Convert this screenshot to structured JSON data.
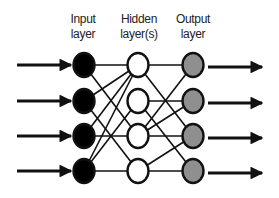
{
  "diagram": {
    "layers": [
      {
        "name": "input",
        "label_line1": "Input",
        "label_line2": "layer",
        "node_count": 4,
        "fill": "#000000"
      },
      {
        "name": "hidden",
        "label_line1": "Hidden",
        "label_line2": "layer(s)",
        "node_count": 4,
        "fill": "#ffffff"
      },
      {
        "name": "output",
        "label_line1": "Output",
        "label_line2": "layer",
        "node_count": 4,
        "fill": "#8f8f8f"
      }
    ],
    "input_arrows": 4,
    "output_arrows": 4,
    "edges_input_hidden": [
      [
        0,
        0
      ],
      [
        0,
        2
      ],
      [
        1,
        0
      ],
      [
        1,
        3
      ],
      [
        2,
        0
      ],
      [
        2,
        2
      ],
      [
        3,
        0
      ],
      [
        3,
        1
      ],
      [
        3,
        3
      ]
    ],
    "edges_hidden_output": [
      [
        0,
        0
      ],
      [
        0,
        2
      ],
      [
        1,
        1
      ],
      [
        1,
        3
      ],
      [
        2,
        0
      ],
      [
        2,
        1
      ],
      [
        2,
        2
      ],
      [
        3,
        2
      ],
      [
        3,
        3
      ]
    ]
  }
}
